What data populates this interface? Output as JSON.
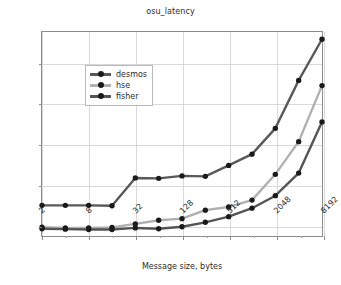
{
  "chart_data": {
    "type": "line",
    "title": "osu_latency",
    "xlabel": "Message size, bytes",
    "ylabel": "Time, usec",
    "xscale": "log2",
    "x": [
      2,
      4,
      8,
      16,
      32,
      64,
      128,
      256,
      512,
      1024,
      2048,
      4096,
      8192
    ],
    "xtick_labels": [
      "2",
      "8",
      "32",
      "128",
      "512",
      "2048",
      "8192"
    ],
    "xtick_values": [
      2,
      8,
      32,
      128,
      512,
      2048,
      8192
    ],
    "ytick_labels": [
      "1",
      "2",
      "3",
      "4",
      "5"
    ],
    "ytick_values": [
      1,
      2,
      3,
      4,
      5
    ],
    "xlim": [
      2,
      8192
    ],
    "ylim": [
      0.72,
      5.78
    ],
    "grid": true,
    "legend_position": "upper left",
    "series": [
      {
        "name": "desmos",
        "color": "#595959",
        "marker": "o",
        "values": [
          1.48,
          1.48,
          1.48,
          1.47,
          2.16,
          2.15,
          2.21,
          2.2,
          2.47,
          2.75,
          3.39,
          4.58,
          5.6
        ]
      },
      {
        "name": "hse",
        "color": "#b0b0b0",
        "marker": "o",
        "values": [
          0.94,
          0.92,
          0.92,
          0.93,
          1.02,
          1.11,
          1.15,
          1.36,
          1.44,
          1.61,
          2.25,
          3.06,
          4.45
        ]
      },
      {
        "name": "fisher",
        "color": "#555555",
        "marker": "o",
        "values": [
          0.9,
          0.89,
          0.88,
          0.88,
          0.92,
          0.9,
          0.95,
          1.06,
          1.2,
          1.41,
          1.72,
          2.28,
          3.55
        ]
      }
    ]
  }
}
